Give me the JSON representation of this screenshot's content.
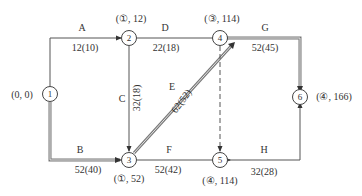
{
  "diagram": {
    "type": "network-schedule",
    "colors": {
      "line": "#555555",
      "critical": "#777777",
      "text": "#333333",
      "background": "#ffffff"
    },
    "nodes": [
      {
        "id": "1",
        "label": "1",
        "annotation": "(0, 0)"
      },
      {
        "id": "2",
        "label": "2",
        "annotation": "(①, 12)"
      },
      {
        "id": "3",
        "label": "3",
        "annotation": "(①, 52)"
      },
      {
        "id": "4",
        "label": "4",
        "annotation": "(③, 114)"
      },
      {
        "id": "5",
        "label": "5",
        "annotation": "(④, 114)"
      },
      {
        "id": "6",
        "label": "6",
        "annotation": "(④, 166)"
      }
    ],
    "edges": [
      {
        "name": "A",
        "from": "1",
        "to": "2",
        "value": "12(10)",
        "critical": false
      },
      {
        "name": "B",
        "from": "1",
        "to": "3",
        "value": "52(40)",
        "critical": true
      },
      {
        "name": "C",
        "from": "2",
        "to": "3",
        "value": "32(18)",
        "critical": false
      },
      {
        "name": "D",
        "from": "2",
        "to": "4",
        "value": "22(18)",
        "critical": false
      },
      {
        "name": "E",
        "from": "3",
        "to": "4",
        "value": "62(52)",
        "critical": true
      },
      {
        "name": "F",
        "from": "3",
        "to": "5",
        "value": "52(42)",
        "critical": false
      },
      {
        "name": "G",
        "from": "4",
        "to": "6",
        "value": "52(45)",
        "critical": true
      },
      {
        "name": "H",
        "from": "5",
        "to": "6",
        "value": "32(28)",
        "critical": false
      },
      {
        "name": "dummy",
        "from": "4",
        "to": "5",
        "value": "",
        "critical": false,
        "dashed": true
      }
    ]
  }
}
